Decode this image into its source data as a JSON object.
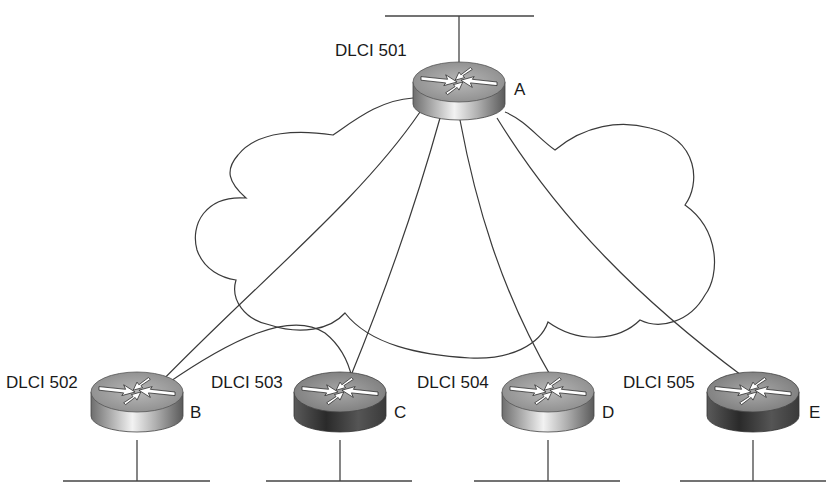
{
  "diagram": {
    "type": "frame-relay-hub-and-spoke",
    "cloud": {
      "label": ""
    },
    "routers": [
      {
        "id": "A",
        "label": "A",
        "dlci": "DLCI 501",
        "role": "hub",
        "shade": "light"
      },
      {
        "id": "B",
        "label": "B",
        "dlci": "DLCI 502",
        "role": "spoke",
        "shade": "light"
      },
      {
        "id": "C",
        "label": "C",
        "dlci": "DLCI 503",
        "role": "spoke",
        "shade": "dark"
      },
      {
        "id": "D",
        "label": "D",
        "dlci": "DLCI 504",
        "role": "spoke",
        "shade": "light"
      },
      {
        "id": "E",
        "label": "E",
        "dlci": "DLCI 505",
        "role": "spoke",
        "shade": "dark"
      }
    ],
    "links": [
      {
        "from": "A",
        "to": "B"
      },
      {
        "from": "A",
        "to": "C"
      },
      {
        "from": "A",
        "to": "D"
      },
      {
        "from": "A",
        "to": "E"
      },
      {
        "from": "B",
        "to": "C"
      }
    ],
    "lan_segments": [
      "A",
      "B",
      "C",
      "D",
      "E"
    ]
  },
  "colors": {
    "line": "#3a3a3a",
    "text": "#1a1a1a",
    "router_light": "#b5b5b5",
    "router_dark": "#555555"
  }
}
